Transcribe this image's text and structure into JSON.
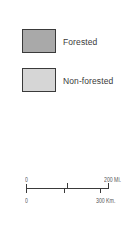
{
  "legend": {
    "items": [
      {
        "label": "Forested",
        "color": "#a9a9a9"
      },
      {
        "label": "Non-forested",
        "color": "#d6d6d6"
      }
    ]
  },
  "scale_bar": {
    "miles": {
      "start": "0",
      "end": "200 Mi.",
      "ticks": [
        "0",
        "100",
        "200"
      ]
    },
    "kilometers": {
      "start": "0",
      "end": "300 Km.",
      "ticks": [
        "0",
        "100",
        "300"
      ]
    }
  }
}
